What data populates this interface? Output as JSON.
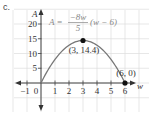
{
  "part_label": "c.",
  "chart_data": {
    "type": "line",
    "title": "",
    "equation": "A = -8w/5 (w - 6)",
    "equation_parts": {
      "lhs": "A =",
      "numerator": "−8w",
      "denominator": "5",
      "rhs": "(w − 6)"
    },
    "xlabel": "w",
    "ylabel": "A",
    "x_ticks": [
      "−1",
      "0",
      "1",
      "2",
      "3",
      "4",
      "5",
      "6"
    ],
    "y_ticks": [
      "5",
      "10",
      "15",
      "20"
    ],
    "xlim": [
      -1.5,
      7
    ],
    "ylim": [
      -5,
      22
    ],
    "grid": true,
    "series": [
      {
        "name": "A = -8w/5 (w - 6)",
        "x": [
          0,
          0.5,
          1,
          1.5,
          2,
          2.5,
          3,
          3.5,
          4,
          4.5,
          5,
          5.5,
          6
        ],
        "y": [
          0,
          4.4,
          8,
          10.8,
          12.8,
          14,
          14.4,
          14,
          12.8,
          10.8,
          8,
          4.4,
          0
        ]
      }
    ],
    "points": [
      {
        "x": 3,
        "y": 14.4,
        "label": "(3, 14.4)"
      },
      {
        "x": 6,
        "y": 0,
        "label": "(6, 0)"
      }
    ]
  }
}
